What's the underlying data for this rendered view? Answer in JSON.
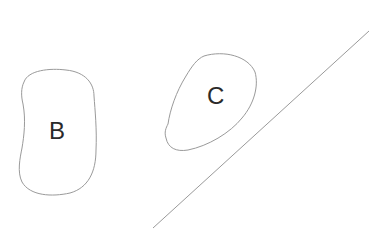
{
  "diagram": {
    "background": "#ffffff",
    "stroke_color": "#9a9a9a",
    "text_color": "#2a2a2a",
    "regions": [
      {
        "id": "B",
        "label": "B",
        "shape": "rounded blob"
      },
      {
        "id": "C",
        "label": "C",
        "shape": "tilted oval"
      }
    ],
    "line": {
      "from": [
        153,
        228
      ],
      "to": [
        369,
        31
      ]
    }
  }
}
